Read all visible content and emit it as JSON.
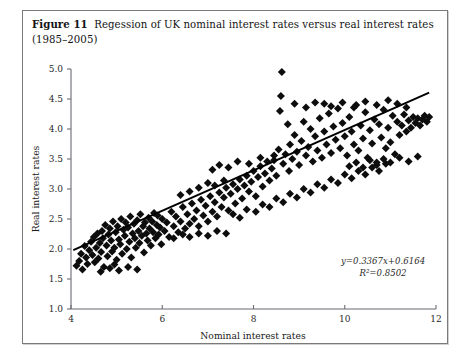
{
  "figure": {
    "number_label": "Figure 11",
    "caption": "Regession of UK nominal interest rates versus real interest rates (1985–2005)"
  },
  "chart_data": {
    "type": "scatter",
    "title": "Regession of UK nominal interest rates versus real interest rates (1985–2005)",
    "xlabel": "Nominal interest rates",
    "ylabel": "Real interest rates",
    "xlim": [
      4,
      12
    ],
    "ylim": [
      1.0,
      5.0
    ],
    "xticks": [
      4,
      6,
      8,
      10,
      12
    ],
    "xtick_labels": [
      "4",
      "6",
      "8",
      "10",
      "12"
    ],
    "yticks": [
      1.0,
      1.5,
      2.0,
      2.5,
      3.0,
      3.5,
      4.0,
      4.5,
      5.0
    ],
    "ytick_labels": [
      "1.0",
      "1.5",
      "2.0",
      "2.5",
      "3.0",
      "3.5",
      "4.0",
      "4.5",
      "5.0"
    ],
    "grid": false,
    "legend": false,
    "marker": "diamond",
    "marker_color": "#0d0d0d",
    "annotations": [
      {
        "name": "regression-equation",
        "text": "y=0.3367x+0.6164"
      },
      {
        "name": "r-squared",
        "text": "R²=0.8502"
      }
    ],
    "trendline": {
      "type": "linear",
      "slope": 0.3367,
      "intercept": 0.6164,
      "equation": "y=0.3367x+0.6164",
      "r_squared": 0.8502,
      "x_start": 4.05,
      "x_end": 11.85,
      "color": "#000000"
    },
    "points": [
      [
        4.12,
        1.72
      ],
      [
        4.18,
        1.8
      ],
      [
        4.22,
        1.92
      ],
      [
        4.25,
        1.66
      ],
      [
        4.3,
        2.05
      ],
      [
        4.33,
        1.86
      ],
      [
        4.36,
        1.75
      ],
      [
        4.4,
        1.98
      ],
      [
        4.44,
        2.12
      ],
      [
        4.47,
        1.9
      ],
      [
        4.5,
        2.2
      ],
      [
        4.52,
        1.78
      ],
      [
        4.55,
        2.02
      ],
      [
        4.58,
        2.26
      ],
      [
        4.6,
        1.84
      ],
      [
        4.63,
        2.1
      ],
      [
        4.66,
        1.95
      ],
      [
        4.68,
        2.3
      ],
      [
        4.7,
        2.18
      ],
      [
        4.72,
        1.7
      ],
      [
        4.75,
        2.4
      ],
      [
        4.78,
        2.06
      ],
      [
        4.8,
        1.88
      ],
      [
        4.82,
        2.24
      ],
      [
        4.85,
        2.34
      ],
      [
        4.88,
        2.14
      ],
      [
        4.9,
        1.96
      ],
      [
        4.92,
        2.46
      ],
      [
        4.95,
        2.02
      ],
      [
        4.98,
        2.28
      ],
      [
        5.0,
        1.82
      ],
      [
        5.02,
        2.38
      ],
      [
        5.05,
        2.16
      ],
      [
        5.08,
        2.08
      ],
      [
        5.1,
        2.5
      ],
      [
        5.12,
        1.92
      ],
      [
        5.15,
        2.32
      ],
      [
        5.18,
        2.22
      ],
      [
        5.2,
        2.44
      ],
      [
        5.22,
        2.0
      ],
      [
        5.25,
        2.36
      ],
      [
        5.28,
        2.12
      ],
      [
        5.3,
        2.54
      ],
      [
        5.32,
        1.86
      ],
      [
        5.35,
        2.26
      ],
      [
        5.38,
        2.42
      ],
      [
        5.4,
        2.18
      ],
      [
        5.42,
        2.02
      ],
      [
        5.45,
        2.48
      ],
      [
        5.48,
        2.3
      ],
      [
        5.5,
        2.1
      ],
      [
        5.52,
        2.58
      ],
      [
        5.55,
        2.22
      ],
      [
        5.58,
        2.38
      ],
      [
        5.6,
        1.94
      ],
      [
        5.62,
        2.44
      ],
      [
        5.65,
        2.26
      ],
      [
        5.68,
        2.14
      ],
      [
        5.7,
        2.52
      ],
      [
        5.72,
        2.34
      ],
      [
        5.75,
        2.06
      ],
      [
        5.78,
        2.46
      ],
      [
        5.8,
        2.28
      ],
      [
        5.82,
        2.6
      ],
      [
        5.85,
        2.18
      ],
      [
        5.88,
        2.4
      ],
      [
        5.9,
        2.56
      ],
      [
        5.92,
        2.24
      ],
      [
        5.95,
        2.36
      ],
      [
        5.98,
        2.08
      ],
      [
        6.0,
        2.5
      ],
      [
        6.05,
        2.3
      ],
      [
        6.1,
        2.44
      ],
      [
        6.15,
        2.2
      ],
      [
        6.2,
        2.62
      ],
      [
        6.25,
        2.38
      ],
      [
        6.3,
        2.54
      ],
      [
        6.35,
        2.28
      ],
      [
        6.4,
        2.46
      ],
      [
        6.45,
        2.7
      ],
      [
        6.5,
        2.34
      ],
      [
        6.55,
        2.58
      ],
      [
        6.6,
        2.42
      ],
      [
        6.65,
        2.76
      ],
      [
        6.7,
        2.5
      ],
      [
        6.75,
        2.64
      ],
      [
        6.8,
        2.38
      ],
      [
        6.85,
        2.82
      ],
      [
        6.9,
        2.56
      ],
      [
        6.95,
        2.72
      ],
      [
        7.0,
        2.46
      ],
      [
        7.05,
        2.88
      ],
      [
        7.1,
        2.62
      ],
      [
        7.15,
        2.78
      ],
      [
        7.2,
        2.54
      ],
      [
        7.25,
        2.94
      ],
      [
        7.3,
        2.7
      ],
      [
        7.35,
        2.86
      ],
      [
        7.4,
        3.02
      ],
      [
        7.45,
        2.64
      ],
      [
        7.5,
        2.92
      ],
      [
        7.55,
        3.08
      ],
      [
        7.6,
        2.76
      ],
      [
        7.65,
        3.0
      ],
      [
        7.7,
        3.16
      ],
      [
        7.75,
        2.84
      ],
      [
        7.8,
        3.06
      ],
      [
        7.85,
        3.22
      ],
      [
        7.9,
        2.96
      ],
      [
        7.95,
        3.12
      ],
      [
        8.0,
        3.3
      ],
      [
        8.05,
        2.88
      ],
      [
        8.1,
        3.2
      ],
      [
        8.15,
        3.38
      ],
      [
        8.2,
        3.04
      ],
      [
        8.25,
        3.26
      ],
      [
        8.3,
        3.46
      ],
      [
        8.35,
        3.14
      ],
      [
        8.4,
        3.34
      ],
      [
        8.45,
        3.56
      ],
      [
        8.5,
        3.22
      ],
      [
        8.55,
        3.66
      ],
      [
        8.58,
        4.3
      ],
      [
        8.6,
        4.55
      ],
      [
        8.62,
        4.95
      ],
      [
        8.65,
        3.42
      ],
      [
        8.7,
        3.58
      ],
      [
        8.75,
        4.08
      ],
      [
        8.78,
        3.3
      ],
      [
        8.8,
        3.74
      ],
      [
        8.85,
        3.5
      ],
      [
        8.9,
        3.9
      ],
      [
        8.95,
        3.62
      ],
      [
        9.0,
        3.4
      ],
      [
        9.05,
        3.8
      ],
      [
        9.1,
        4.12
      ],
      [
        9.15,
        3.56
      ],
      [
        9.2,
        3.7
      ],
      [
        9.25,
        4.0
      ],
      [
        9.3,
        3.46
      ],
      [
        9.35,
        3.88
      ],
      [
        9.4,
        3.64
      ],
      [
        9.45,
        4.18
      ],
      [
        9.5,
        3.52
      ],
      [
        9.55,
        3.96
      ],
      [
        9.6,
        3.74
      ],
      [
        9.65,
        4.26
      ],
      [
        9.7,
        3.6
      ],
      [
        9.75,
        4.04
      ],
      [
        9.8,
        3.82
      ],
      [
        9.85,
        4.34
      ],
      [
        9.9,
        3.68
      ],
      [
        9.95,
        4.1
      ],
      [
        10.0,
        3.88
      ],
      [
        10.05,
        3.56
      ],
      [
        10.1,
        4.2
      ],
      [
        10.15,
        3.96
      ],
      [
        10.2,
        3.74
      ],
      [
        10.25,
        4.4
      ],
      [
        10.3,
        3.64
      ],
      [
        10.35,
        4.06
      ],
      [
        10.4,
        3.84
      ],
      [
        10.45,
        4.28
      ],
      [
        10.5,
        3.52
      ],
      [
        10.55,
        3.98
      ],
      [
        10.6,
        3.76
      ],
      [
        10.65,
        4.16
      ],
      [
        10.7,
        3.44
      ],
      [
        10.75,
        4.08
      ],
      [
        10.8,
        3.86
      ],
      [
        10.85,
        4.32
      ],
      [
        10.9,
        3.68
      ],
      [
        10.95,
        4.02
      ],
      [
        11.0,
        3.78
      ],
      [
        11.05,
        4.22
      ],
      [
        11.1,
        3.58
      ],
      [
        11.15,
        4.12
      ],
      [
        11.2,
        3.9
      ],
      [
        11.25,
        4.06
      ],
      [
        11.3,
        4.24
      ],
      [
        11.35,
        3.96
      ],
      [
        11.4,
        4.14
      ],
      [
        11.45,
        4.02
      ],
      [
        11.5,
        4.2
      ],
      [
        11.55,
        4.1
      ],
      [
        11.6,
        4.18
      ],
      [
        11.65,
        4.06
      ],
      [
        11.7,
        4.16
      ],
      [
        11.75,
        4.22
      ],
      [
        11.8,
        4.12
      ],
      [
        11.85,
        4.2
      ],
      [
        7.55,
        2.58
      ],
      [
        7.7,
        2.52
      ],
      [
        7.85,
        2.66
      ],
      [
        8.05,
        2.62
      ],
      [
        8.2,
        2.74
      ],
      [
        8.35,
        2.7
      ],
      [
        8.5,
        2.84
      ],
      [
        8.65,
        2.78
      ],
      [
        8.8,
        2.92
      ],
      [
        8.95,
        2.86
      ],
      [
        9.1,
        3.0
      ],
      [
        9.25,
        2.94
      ],
      [
        9.4,
        3.08
      ],
      [
        9.55,
        3.02
      ],
      [
        9.7,
        3.16
      ],
      [
        9.85,
        3.1
      ],
      [
        10.0,
        3.24
      ],
      [
        10.15,
        3.18
      ],
      [
        10.3,
        3.3
      ],
      [
        10.45,
        3.24
      ],
      [
        10.6,
        3.36
      ],
      [
        10.75,
        3.3
      ],
      [
        10.9,
        3.42
      ],
      [
        6.25,
        2.18
      ],
      [
        6.45,
        2.24
      ],
      [
        6.6,
        2.2
      ],
      [
        6.8,
        2.26
      ],
      [
        7.0,
        2.22
      ],
      [
        7.2,
        2.3
      ],
      [
        7.4,
        2.26
      ],
      [
        9.55,
        4.42
      ],
      [
        9.7,
        4.38
      ],
      [
        9.95,
        4.44
      ],
      [
        10.2,
        4.36
      ],
      [
        10.45,
        4.46
      ],
      [
        10.7,
        4.4
      ],
      [
        10.95,
        4.48
      ],
      [
        11.15,
        4.42
      ],
      [
        11.35,
        4.36
      ],
      [
        8.9,
        4.42
      ],
      [
        9.15,
        4.36
      ],
      [
        9.35,
        4.44
      ],
      [
        10.1,
        3.38
      ],
      [
        10.25,
        3.44
      ],
      [
        10.4,
        3.36
      ],
      [
        10.55,
        3.48
      ],
      [
        10.7,
        3.4
      ],
      [
        10.85,
        3.5
      ],
      [
        11.0,
        3.44
      ],
      [
        11.2,
        3.52
      ],
      [
        11.4,
        3.46
      ],
      [
        11.6,
        3.54
      ],
      [
        5.05,
        1.64
      ],
      [
        5.25,
        1.7
      ],
      [
        5.45,
        1.66
      ],
      [
        4.95,
        1.74
      ],
      [
        4.65,
        1.62
      ],
      [
        4.85,
        1.68
      ],
      [
        7.1,
        3.32
      ],
      [
        7.25,
        3.4
      ],
      [
        7.45,
        3.36
      ],
      [
        7.65,
        3.46
      ],
      [
        7.9,
        3.42
      ],
      [
        8.15,
        3.52
      ],
      [
        8.45,
        3.48
      ],
      [
        6.8,
        3.02
      ],
      [
        7.0,
        3.1
      ],
      [
        7.15,
        3.06
      ],
      [
        7.35,
        3.14
      ],
      [
        6.6,
        2.96
      ],
      [
        6.4,
        2.9
      ]
    ]
  }
}
